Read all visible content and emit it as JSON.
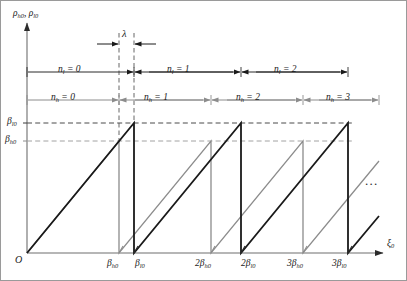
{
  "figure": {
    "title": "",
    "axes": {
      "y_axis_label_html": "&#961;<sub>h0</sub>, &#961;<sub>l0</sub>",
      "x_axis_label_html": "&#958;<sub>0</sub>",
      "origin_label": "O"
    },
    "y_ticks": [
      {
        "label_html": "&#946;<sub>l0</sub>",
        "value_px": 122,
        "color": "#3a3a3a"
      },
      {
        "label_html": "&#946;<sub>h0</sub>",
        "value_px": 140,
        "color": "#8c8c8c"
      }
    ],
    "x_ticks": [
      {
        "label_html": "&#946;<sub>h0</sub>",
        "x_px": 118,
        "color": "#8c8c8c"
      },
      {
        "label_html": "&#946;<sub>l0</sub>",
        "x_px": 133,
        "color": "#2b2b2b"
      },
      {
        "label_html": "2&#946;<sub>h0</sub>",
        "x_px": 210,
        "color": "#8c8c8c"
      },
      {
        "label_html": "2&#946;<sub>l0</sub>",
        "x_px": 240,
        "color": "#2b2b2b"
      },
      {
        "label_html": "3&#946;<sub>h0</sub>",
        "x_px": 302,
        "color": "#8c8c8c"
      },
      {
        "label_html": "3&#946;<sub>l0</sub>",
        "x_px": 347,
        "color": "#2b2b2b"
      }
    ],
    "annotations": {
      "lambda_label_html": "&#955;",
      "ellipsis": "..."
    },
    "regions_nl": [
      {
        "label_html": "n<sub>l</sub> = 0"
      },
      {
        "label_html": "n<sub>l</sub> = 1"
      },
      {
        "label_html": "n<sub>l</sub> = 2"
      }
    ],
    "regions_nh": [
      {
        "label_html": "n<sub>h</sub> = 0"
      },
      {
        "label_html": "n<sub>h</sub> = 1"
      },
      {
        "label_html": "n<sub>h</sub> = 2"
      },
      {
        "label_html": "n<sub>h</sub> = 3"
      }
    ]
  },
  "chart_data": {
    "type": "line",
    "title": "",
    "xlabel": "xi_0",
    "ylabel": "rho_h0, rho_l0",
    "grid": false,
    "legend": "none",
    "axis_origin_px": {
      "x": 26,
      "y": 252
    },
    "xlim_px": [
      26,
      378
    ],
    "ylim_px": [
      252,
      20
    ],
    "levels": {
      "beta_l0_y_px": 122,
      "beta_h0_y_px": 140
    },
    "series": [
      {
        "name": "rho_h0",
        "color": "#8c8c8c",
        "width": 1.3,
        "description": "sawtooth rising from baseline to beta_h0 level, period beta_h0",
        "points_px": [
          [
            26,
            252
          ],
          [
            118,
            140
          ],
          [
            118,
            252
          ],
          [
            210,
            140
          ],
          [
            210,
            252
          ],
          [
            302,
            140
          ],
          [
            302,
            252
          ],
          [
            378,
            160
          ]
        ]
      },
      {
        "name": "rho_l0",
        "color": "#1a1a1a",
        "width": 1.8,
        "description": "sawtooth rising from baseline to beta_l0 level, period beta_l0",
        "points_px": [
          [
            26,
            252
          ],
          [
            133,
            122
          ],
          [
            133,
            252
          ],
          [
            240,
            122
          ],
          [
            240,
            252
          ],
          [
            347,
            122
          ],
          [
            347,
            252
          ],
          [
            378,
            215
          ]
        ]
      }
    ],
    "region_bars": [
      {
        "name": "n_l regions",
        "y_px": 71,
        "color": "#2b2b2b",
        "boundaries_px": [
          26,
          133,
          240,
          347
        ],
        "labels": [
          "n_l = 0",
          "n_l = 1",
          "n_l = 2"
        ]
      },
      {
        "name": "n_h regions",
        "y_px": 99,
        "color": "#8c8c8c",
        "boundaries_px": [
          26,
          118,
          210,
          302,
          378
        ],
        "labels": [
          "n_h = 0",
          "n_h = 1",
          "n_h = 2",
          "n_h = 3"
        ]
      }
    ],
    "lambda_span_px": {
      "x_start": 118,
      "x_end": 133,
      "y_px": 43
    }
  }
}
